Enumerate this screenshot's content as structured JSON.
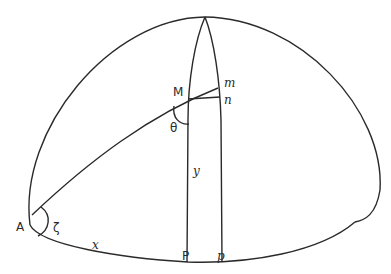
{
  "diagram": {
    "type": "spherical-geometry",
    "labels": {
      "A": "A",
      "M": "M",
      "m": "m",
      "n": "n",
      "theta": "θ",
      "zeta": "ζ",
      "y": "y",
      "x": "x",
      "P": "P",
      "p": "p"
    }
  }
}
